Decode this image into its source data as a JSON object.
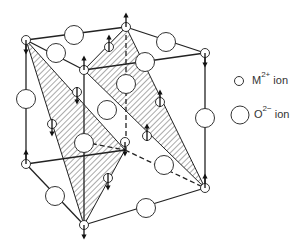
{
  "diagram": {
    "title": "",
    "legend": [
      {
        "symbol": "small-circle",
        "ion": "M",
        "charge": "2+",
        "suffix": "ion"
      },
      {
        "symbol": "large-circle",
        "ion": "O",
        "charge": "2−",
        "suffix": "ion"
      }
    ],
    "stroke_color": "#222222",
    "hatch_color": "#555555"
  }
}
